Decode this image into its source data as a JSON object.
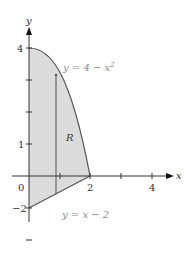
{
  "diagram": {
    "region_label": "R",
    "curves": [
      {
        "name": "parabola",
        "label": "y = 4 − x²",
        "equation_prefix": "y = 4 − x",
        "superscript": "2"
      },
      {
        "name": "line",
        "label": "y = x − 2"
      }
    ],
    "axes": {
      "x_label": "x",
      "y_label": "y",
      "origin_label": "0",
      "x_ticks": [
        {
          "value": 2,
          "label": "2"
        },
        {
          "value": 4,
          "label": "4"
        }
      ],
      "y_ticks": [
        {
          "value": 4,
          "label": "4"
        },
        {
          "value": 1,
          "label": "1"
        },
        {
          "value": -2,
          "label": "-2"
        }
      ]
    },
    "colors": {
      "region_fill": "#dcdcdc",
      "curve_stroke": "#555555",
      "axis_stroke": "#333333",
      "equation_text": "#8a8a8a"
    }
  }
}
